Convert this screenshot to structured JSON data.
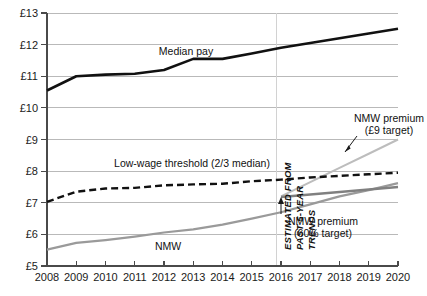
{
  "chart_data": {
    "type": "line",
    "title": "",
    "xlabel": "",
    "ylabel": "",
    "xlim": [
      2008,
      2020
    ],
    "ylim": [
      5,
      13
    ],
    "grid": true,
    "legend_position": "inline-annotations",
    "x": [
      2008,
      2009,
      2010,
      2011,
      2012,
      2013,
      2014,
      2015,
      2016,
      2017,
      2018,
      2019,
      2020
    ],
    "x_tick_labels": [
      "2008",
      "2009",
      "2010",
      "2011",
      "2012",
      "2013",
      "2014",
      "2015",
      "2016",
      "2017",
      "2018",
      "2019",
      "2020"
    ],
    "y_ticks": [
      5,
      6,
      7,
      8,
      9,
      10,
      11,
      12,
      13
    ],
    "y_tick_labels": [
      "£5",
      "£6",
      "£7",
      "£8",
      "£9",
      "£10",
      "£11",
      "£12",
      "£13"
    ],
    "currency_symbol": "£",
    "forecast_divider_x": 2016,
    "series": [
      {
        "name": "Median pay",
        "label": "Median pay",
        "style": "solid-thick-black",
        "color": "#111111",
        "x": [
          2008,
          2009,
          2010,
          2011,
          2012,
          2013,
          2014,
          2015,
          2016,
          2017,
          2018,
          2019,
          2020
        ],
        "values": [
          10.55,
          11.0,
          11.05,
          11.08,
          11.2,
          11.55,
          11.55,
          11.72,
          11.9,
          12.05,
          12.2,
          12.35,
          12.5
        ]
      },
      {
        "name": "Low-wage threshold (2/3 median)",
        "label": "Low-wage threshold (2/3 median)",
        "style": "dashed-black",
        "color": "#111111",
        "x": [
          2008,
          2009,
          2010,
          2011,
          2012,
          2013,
          2014,
          2015,
          2016,
          2017,
          2018,
          2019,
          2020
        ],
        "values": [
          7.03,
          7.35,
          7.45,
          7.47,
          7.55,
          7.58,
          7.6,
          7.68,
          7.73,
          7.8,
          7.85,
          7.9,
          7.95
        ]
      },
      {
        "name": "NMW",
        "label": "NMW",
        "style": "solid-grey",
        "color": "#9a9a9a",
        "x": [
          2008,
          2009,
          2010,
          2011,
          2012,
          2013,
          2014,
          2015,
          2016,
          2017,
          2018,
          2019,
          2020
        ],
        "values": [
          5.52,
          5.73,
          5.82,
          5.93,
          6.06,
          6.16,
          6.31,
          6.5,
          6.7,
          6.95,
          7.2,
          7.4,
          7.62
        ]
      },
      {
        "name": "NMW premium (£9 target)",
        "label": "NMW premium",
        "sublabel": "(£9 target)",
        "style": "solid-light-grey",
        "color": "#bdbdbd",
        "x": [
          2016,
          2017,
          2018,
          2019,
          2020
        ],
        "values": [
          7.2,
          7.65,
          8.1,
          8.55,
          9.0
        ]
      },
      {
        "name": "NMW premium (60% target)",
        "label": "NMW premium",
        "sublabel": "(60% target)",
        "style": "solid-mid-grey",
        "color": "#808080",
        "x": [
          2016,
          2017,
          2018,
          2019,
          2020
        ],
        "values": [
          7.18,
          7.26,
          7.34,
          7.42,
          7.5
        ]
      }
    ],
    "annotations": [
      {
        "name": "forecast-note",
        "text": "ESTIMATED FROM PAST 5-YEAR TRENDS",
        "lines": [
          "ESTIMATED FROM",
          "PAST 5-YEAR",
          "TRENDS"
        ],
        "orientation": "vertical",
        "at_x": 2016
      }
    ]
  },
  "labels": {
    "median_pay": "Median pay",
    "low_wage_threshold": "Low-wage threshold (2/3 median)",
    "nmw": "NMW",
    "premium9_line1": "NMW premium",
    "premium9_line2": "(£9 target)",
    "premium60_line1": "NMW premium",
    "premium60_line2": "(60% target)",
    "estimate_line1": "ESTIMATED FROM",
    "estimate_line2": "PAST 5-YEAR",
    "estimate_line3": "TRENDS"
  },
  "axes": {
    "y_labels": [
      "£13",
      "£12",
      "£11",
      "£10",
      "£9",
      "£8",
      "£7",
      "£6",
      "£5"
    ],
    "x_labels": [
      "2008",
      "2009",
      "2010",
      "2011",
      "2012",
      "2013",
      "2014",
      "2015",
      "2016",
      "2017",
      "2018",
      "2019",
      "2020"
    ]
  },
  "colors": {
    "median_pay": "#111111",
    "threshold": "#111111",
    "nmw": "#9a9a9a",
    "premium_9_target": "#bdbdbd",
    "premium_60_target": "#808080",
    "gridline": "#b9b9b9",
    "axis": "#4a4a4a",
    "background": "#ffffff"
  }
}
